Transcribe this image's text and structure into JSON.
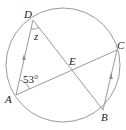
{
  "figure": {
    "points": {
      "A": {
        "label": "A",
        "x": 16,
        "y": 95
      },
      "B": {
        "label": "B",
        "x": 103,
        "y": 110
      },
      "C": {
        "label": "C",
        "x": 117,
        "y": 50
      },
      "D": {
        "label": "D",
        "x": 33,
        "y": 20
      },
      "E": {
        "label": "E",
        "x": 74,
        "y": 69
      }
    },
    "circle": {
      "cx": 63,
      "cy": 65,
      "r": 57
    },
    "angle_A_label": "53°",
    "angle_D_label": "z",
    "colors": {
      "stroke": "#9a9a9a",
      "text": "#222222",
      "arrow": "#8a8a8a"
    }
  }
}
